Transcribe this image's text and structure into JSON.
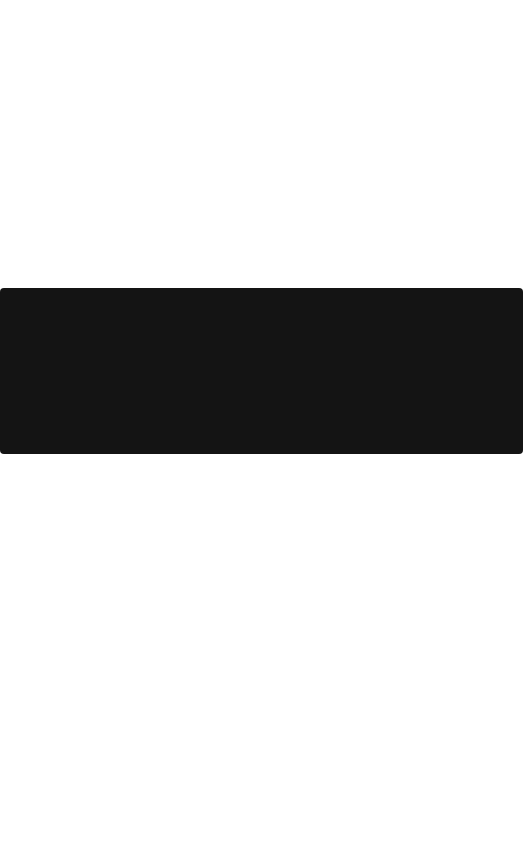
{
  "page": {
    "background_color": "#ffffff"
  },
  "media_block": {
    "background_color": "#141414",
    "content": ""
  }
}
